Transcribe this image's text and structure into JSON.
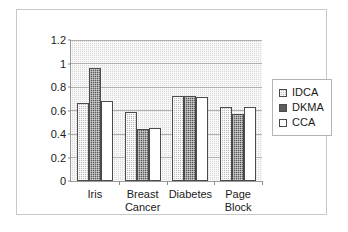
{
  "chart_data": {
    "type": "bar",
    "title": "",
    "subtitle": "",
    "xlabel": "",
    "ylabel": "",
    "categories": [
      "Iris",
      "Breast Cancer",
      "Diabetes",
      "Page Block"
    ],
    "category_lines": [
      [
        "Iris"
      ],
      [
        "Breast",
        "Cancer"
      ],
      [
        "Diabetes"
      ],
      [
        "Page",
        "Block"
      ]
    ],
    "series": [
      {
        "name": "IDCA",
        "values": [
          0.66,
          0.59,
          0.72,
          0.63
        ],
        "color": "#b9b9b9",
        "pattern": "light-checker"
      },
      {
        "name": "DKMA",
        "values": [
          0.96,
          0.44,
          0.72,
          0.57
        ],
        "color": "#5c5c5c",
        "pattern": "dark-checker"
      },
      {
        "name": "CCA",
        "values": [
          0.68,
          0.45,
          0.715,
          0.63
        ],
        "color": "#ffffff",
        "pattern": "solid"
      }
    ],
    "ylim": [
      0,
      1.2
    ],
    "yticks": [
      0,
      0.2,
      0.4,
      0.6,
      0.8,
      1,
      1.2
    ],
    "ytick_labels": [
      "0",
      "0.2",
      "0.4",
      "0.6",
      "0.8",
      "1",
      "1.2"
    ],
    "grid": "horizontal",
    "legend_position": "right",
    "plot_background": "#d9d9d9",
    "frame_color": "#c8c8c8",
    "axis_color": "#9a9a9a"
  },
  "legend": {
    "items": [
      {
        "label": "IDCA"
      },
      {
        "label": "DKMA"
      },
      {
        "label": "CCA"
      }
    ]
  }
}
